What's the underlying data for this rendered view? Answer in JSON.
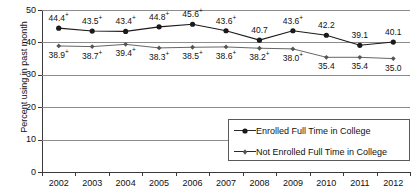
{
  "chart_data": {
    "type": "line",
    "title": "",
    "xlabel": "",
    "ylabel": "Percent using in past month",
    "categories": [
      "2002",
      "2003",
      "2004",
      "2005",
      "2006",
      "2007",
      "2008",
      "2009",
      "2010",
      "2011",
      "2012"
    ],
    "ylim": [
      0,
      50
    ],
    "yticks": [
      0,
      10,
      20,
      30,
      40,
      50
    ],
    "grid": true,
    "legend_position": "lower-right",
    "series": [
      {
        "name": "Enrolled Full Time in College",
        "marker": "filled-circle",
        "values": [
          44.4,
          43.5,
          43.4,
          44.8,
          45.6,
          43.6,
          40.7,
          43.6,
          42.2,
          39.1,
          40.1
        ],
        "labels": [
          "44.4",
          "43.5",
          "43.4",
          "44.8",
          "45.6",
          "43.6",
          "40.7",
          "43.6",
          "42.2",
          "39.1",
          "40.1"
        ],
        "significance": [
          "+",
          "+",
          "+",
          "+",
          "+",
          "+",
          "",
          "+",
          "",
          "",
          ""
        ]
      },
      {
        "name": "Not Enrolled Full Time in College",
        "marker": "small-diamond",
        "values": [
          38.9,
          38.7,
          39.4,
          38.3,
          38.5,
          38.6,
          38.2,
          38.0,
          35.4,
          35.4,
          35.0
        ],
        "labels": [
          "38.9",
          "38.7",
          "39.4",
          "38.3",
          "38.5",
          "38.6",
          "38.2",
          "38.0",
          "35.4",
          "35.4",
          "35.0"
        ],
        "significance": [
          "+",
          "+",
          "+",
          "+",
          "+",
          "+",
          "+",
          "+",
          "",
          "",
          ""
        ]
      }
    ]
  },
  "legend": {
    "items": [
      {
        "label": "Enrolled Full Time in College"
      },
      {
        "label": "Not Enrolled Full Time in College"
      }
    ]
  },
  "colors": {
    "series1": "#1a1a1a",
    "series2": "#555555",
    "grid": "#8c8c8c",
    "axis": "#3a3a3a"
  }
}
